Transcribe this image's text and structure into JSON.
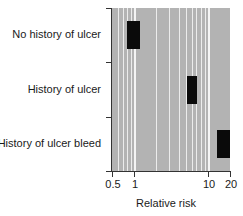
{
  "chart_data": {
    "type": "bar",
    "subtype": "horizontal-range-log",
    "title": "",
    "xlabel": "Relative risk",
    "ylabel": "",
    "xscale": "log",
    "xlim": [
      0.5,
      20
    ],
    "xticks": [
      0.5,
      1,
      10,
      20
    ],
    "xtick_labels": [
      "0.5",
      "1",
      "10",
      "20"
    ],
    "grid": true,
    "categories": [
      "No history of ulcer",
      "History of ulcer",
      "History of ulcer bleed"
    ],
    "series": [
      {
        "name": "Relative risk range",
        "low": [
          0.8,
          5.2,
          13.3
        ],
        "high": [
          1.2,
          7.1,
          20
        ]
      }
    ],
    "colors": {
      "bar": "#0a0a0a",
      "plot_background": "#b3b3b3",
      "gridline": "#ececec"
    }
  }
}
